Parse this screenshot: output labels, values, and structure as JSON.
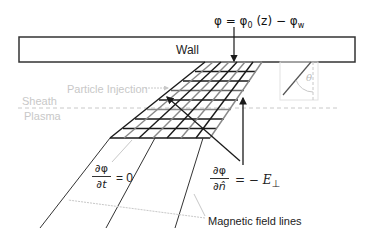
{
  "labels": {
    "wall": "Wall",
    "potential_bc_phi": "φ = φ",
    "potential_bc_sub0": "0",
    "potential_bc_mid": " (z)  − φ",
    "potential_bc_subw": "w",
    "particle_injection": "Particle Injection",
    "sheath": "Sheath",
    "plasma": "Plasma",
    "theta": "θ",
    "time_derivative_num": "∂φ",
    "time_derivative_den": "∂t",
    "time_derivative_eq": "= 0",
    "normal_derivative_num": "∂φ",
    "normal_derivative_den": "∂n̂",
    "normal_derivative_eq": "= − E",
    "normal_derivative_sub": "⊥",
    "magnetic_field_lines": "Magnetic field lines"
  },
  "colors": {
    "stroke": "#1a1a1a",
    "faint": "#c8c8c8",
    "grid_light": "#9a9a9a",
    "background": "#ffffff"
  },
  "geometry": {
    "wall_box": {
      "x": 19,
      "y": 37,
      "width": 336,
      "height": 25
    },
    "sheath_line_y": 108,
    "grid": {
      "top_left": [
        205,
        62
      ],
      "top_right": [
        262,
        62
      ],
      "bottom_left": [
        110,
        138
      ],
      "bottom_right": [
        210,
        138
      ],
      "rows": 8,
      "cols": 7
    },
    "field_lines": [
      {
        "from": [
          110,
          138
        ],
        "to": [
          40,
          228
        ]
      },
      {
        "from": [
          155,
          138
        ],
        "to": [
          106,
          228
        ]
      },
      {
        "from": [
          203,
          138
        ],
        "to": [
          175,
          228
        ]
      }
    ]
  }
}
